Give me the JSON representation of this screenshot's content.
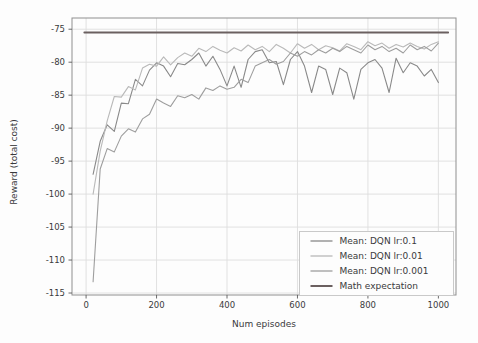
{
  "figure": {
    "background": "#fdfdfd",
    "grid_color": "#dedede",
    "spine_color": "#8f8f8f",
    "tick_color": "#5a5a5a",
    "text_color": "#3a3a3c",
    "legend_border_color": "#c9c9c9",
    "legend_background": "#fdfdfd"
  },
  "chart_data": {
    "type": "line",
    "title": "",
    "xlabel": "Num episodes",
    "ylabel": "Reward (total cost)",
    "xlim": [
      -40,
      1050
    ],
    "ylim": [
      -115.3,
      -73.3
    ],
    "xticks": [
      0,
      200,
      400,
      600,
      800,
      1000
    ],
    "yticks": [
      -75,
      -80,
      -85,
      -90,
      -95,
      -100,
      -105,
      -110,
      -115
    ],
    "grid": true,
    "legend_position": "lower right",
    "x": [
      20,
      40,
      60,
      80,
      100,
      120,
      140,
      160,
      180,
      200,
      220,
      240,
      260,
      280,
      300,
      320,
      340,
      360,
      380,
      400,
      420,
      440,
      460,
      480,
      500,
      520,
      540,
      560,
      580,
      600,
      620,
      640,
      660,
      680,
      700,
      720,
      740,
      760,
      780,
      800,
      820,
      840,
      860,
      880,
      900,
      920,
      940,
      960,
      980,
      1000
    ],
    "series": [
      {
        "name": "Mean: DQN lr:0.1",
        "color": "#898989",
        "width": 1.1,
        "values": [
          -97.0,
          -92.0,
          -89.5,
          -90.5,
          -86.2,
          -86.3,
          -82.6,
          -83.6,
          -81.2,
          -80.1,
          -80.6,
          -82.2,
          -80.2,
          -80.4,
          -79.6,
          -78.6,
          -80.6,
          -79.1,
          -81.1,
          -83.6,
          -80.6,
          -83.8,
          -79.6,
          -78.4,
          -78.1,
          -80.1,
          -79.9,
          -83.4,
          -79.6,
          -78.4,
          -80.6,
          -84.6,
          -80.6,
          -81.1,
          -84.9,
          -80.9,
          -81.6,
          -85.6,
          -81.1,
          -80.1,
          -79.6,
          -80.9,
          -84.6,
          -79.4,
          -81.6,
          -80.1,
          -80.6,
          -82.1,
          -81.1,
          -83.1
        ]
      },
      {
        "name": "Mean: DQN lr:0.01",
        "color": "#b9b9b9",
        "width": 1.1,
        "values": [
          -100.0,
          -93.5,
          -88.9,
          -85.2,
          -85.3,
          -83.7,
          -84.2,
          -80.9,
          -80.3,
          -80.6,
          -79.2,
          -80.4,
          -79.3,
          -78.6,
          -79.1,
          -77.9,
          -78.4,
          -77.6,
          -78.2,
          -78.6,
          -77.8,
          -78.3,
          -77.4,
          -78.1,
          -77.6,
          -78.4,
          -77.3,
          -77.9,
          -78.6,
          -77.2,
          -77.9,
          -77.3,
          -78.1,
          -77.5,
          -77.8,
          -78.3,
          -77.2,
          -77.6,
          -78.1,
          -76.9,
          -77.5,
          -77.1,
          -77.9,
          -77.3,
          -77.7,
          -77.1,
          -77.6,
          -78.0,
          -77.3,
          -76.9
        ]
      },
      {
        "name": "Mean: DQN lr:0.001",
        "color": "#9e9e9e",
        "width": 1.1,
        "values": [
          -113.3,
          -96.2,
          -93.1,
          -93.6,
          -91.2,
          -90.1,
          -90.6,
          -88.6,
          -87.9,
          -85.6,
          -86.2,
          -86.7,
          -85.1,
          -85.4,
          -84.9,
          -85.6,
          -83.9,
          -84.3,
          -83.6,
          -84.1,
          -83.8,
          -82.6,
          -83.1,
          -80.6,
          -80.1,
          -79.6,
          -80.3,
          -79.9,
          -78.6,
          -79.1,
          -78.4,
          -78.9,
          -78.1,
          -78.6,
          -77.9,
          -78.4,
          -77.6,
          -78.1,
          -78.6,
          -77.4,
          -78.1,
          -77.6,
          -78.4,
          -77.9,
          -78.6,
          -77.4,
          -78.1,
          -77.6,
          -78.3,
          -77.1
        ]
      },
      {
        "name": "Math expectation",
        "color": "#6b6060",
        "width": 1.8,
        "flat_value": -75.5,
        "x_span": [
          -5,
          1028
        ]
      }
    ]
  }
}
